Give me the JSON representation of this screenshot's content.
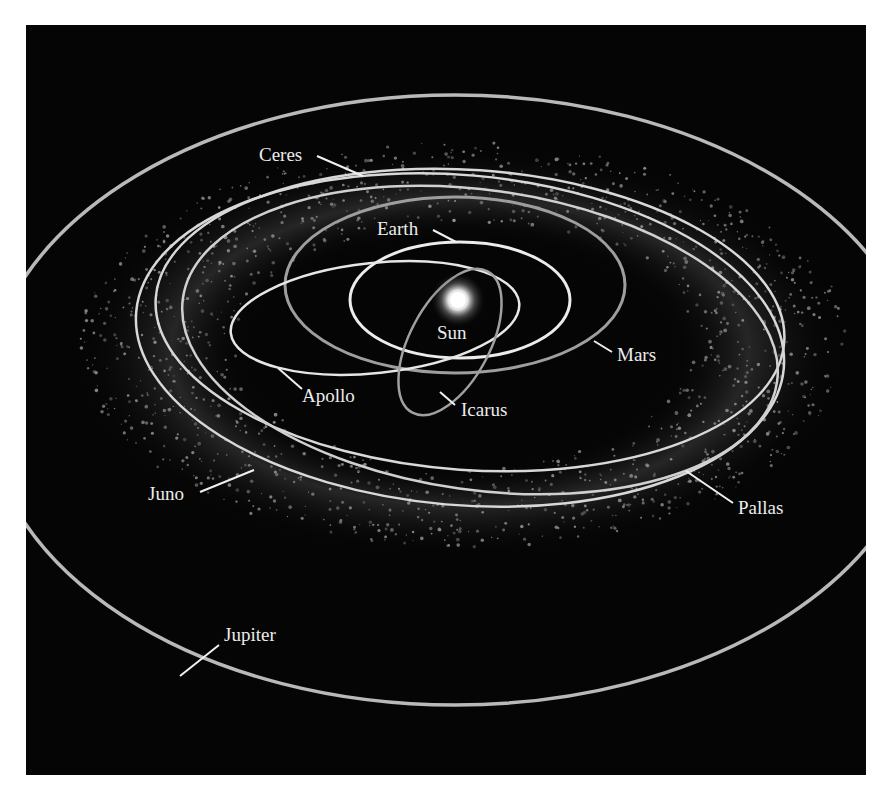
{
  "figure": {
    "type": "asteroid-belt-orbit-diagram",
    "background_color": "#050505",
    "labels": {
      "sun": "Sun",
      "earth": "Earth",
      "mars": "Mars",
      "ceres": "Ceres",
      "apollo": "Apollo",
      "icarus": "Icarus",
      "juno": "Juno",
      "pallas": "Pallas",
      "jupiter": "Jupiter"
    },
    "colors": {
      "orbit_bright": "#e6e6e6",
      "orbit_dim": "#a8a8a8",
      "asteroid_dots": "#9a9a9a",
      "sun_core": "#ffffff"
    }
  }
}
